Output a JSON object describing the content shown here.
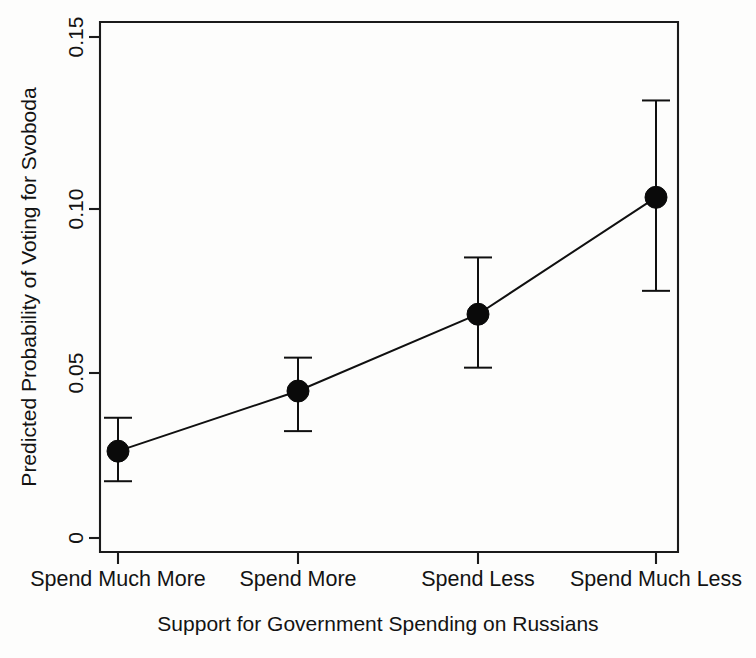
{
  "chart_data": {
    "type": "line",
    "title": "",
    "subtitle": "",
    "xlabel": "Support for Government Spending on Russians",
    "ylabel": "Predicted Probability of Voting for Svoboda",
    "categories": [
      "Spend Much More",
      "Spend More",
      "Spend Less",
      "Spend Much Less"
    ],
    "values": [
      0.026,
      0.044,
      0.067,
      0.102
    ],
    "error_low": [
      0.017,
      0.032,
      0.051,
      0.074
    ],
    "error_high": [
      0.036,
      0.054,
      0.084,
      0.131
    ],
    "ylim": [
      0,
      0.155
    ],
    "yticks": [
      0,
      0.05,
      0.1,
      0.15
    ],
    "ytick_labels": [
      "0",
      "0.05",
      "0.10",
      "0.15"
    ],
    "xtick_labels": [
      "Spend Much More",
      "Spend More",
      "Spend Less",
      "Spend Much Less"
    ],
    "grid": false,
    "legend": "none",
    "marker": "filled-circle",
    "error_bar_style": "capped-vertical",
    "series": [
      {
        "name": "Predicted probability",
        "values": [
          0.026,
          0.044,
          0.067,
          0.102
        ],
        "ci_lower": [
          0.017,
          0.032,
          0.051,
          0.074
        ],
        "ci_upper": [
          0.036,
          0.054,
          0.084,
          0.131
        ]
      }
    ],
    "colors": {
      "line": "#101010",
      "marker": "#0a0a0a",
      "error": "#101010",
      "axis": "#1b1b1b",
      "background": "#fdfdfc"
    }
  },
  "axis": {
    "y_title": "Predicted Probability of Voting for Svoboda",
    "x_title": "Support for Government Spending on Russians",
    "y_ticks": [
      {
        "label": "0.15",
        "value": 0.15
      },
      {
        "label": "0.10",
        "value": 0.1
      },
      {
        "label": "0.05",
        "value": 0.05
      },
      {
        "label": "0",
        "value": 0
      }
    ],
    "x_ticks": [
      {
        "label": "Spend Much More"
      },
      {
        "label": "Spend More"
      },
      {
        "label": "Spend Less"
      },
      {
        "label": "Spend Much Less"
      }
    ]
  }
}
